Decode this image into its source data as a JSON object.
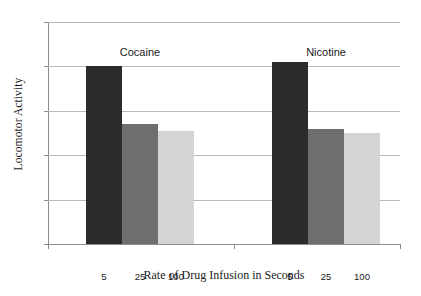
{
  "chart_data": {
    "type": "bar",
    "title": "",
    "xlabel": "Rate of Drug Infusion in Seconds",
    "ylabel": "Locomotor Activity",
    "categories": [
      "5",
      "25",
      "100"
    ],
    "groups": [
      "Cocaine",
      "Nicotine"
    ],
    "series": [
      {
        "name": "Cocaine",
        "values": [
          80,
          54,
          51
        ]
      },
      {
        "name": "Nicotine",
        "values": [
          82,
          52,
          50
        ]
      }
    ],
    "ylim": [
      0,
      100
    ],
    "yticks": [
      0,
      20,
      40,
      60,
      80,
      100
    ],
    "ytick_labels": [
      "0",
      "20",
      "40",
      "60",
      "80",
      "100"
    ],
    "grid": true,
    "legend": "none",
    "bar_colors": [
      "#2b2b2b",
      "#6e6e6e",
      "#d4d4d4"
    ],
    "gridline_color": "#b9b9b9",
    "axis_color": "#8d8d8d",
    "background": "#ffffff"
  }
}
